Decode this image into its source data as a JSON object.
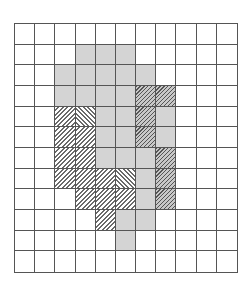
{
  "figure": {
    "rows": 12,
    "cols": 11,
    "legend": {
      "empty": "white cell",
      "gray": "gray shaded cell",
      "hr": "light diagonal hatch (\\)",
      "hl": "light diagonal hatch (/)",
      "dk": "dark diagonal hatch on gray (/)"
    },
    "cells": [
      [
        "empty",
        "empty",
        "empty",
        "empty",
        "empty",
        "empty",
        "empty",
        "empty",
        "empty",
        "empty",
        "empty"
      ],
      [
        "empty",
        "empty",
        "empty",
        "gray",
        "gray",
        "gray",
        "empty",
        "empty",
        "empty",
        "empty",
        "empty"
      ],
      [
        "empty",
        "empty",
        "gray",
        "gray",
        "gray",
        "gray",
        "gray",
        "empty",
        "empty",
        "empty",
        "empty"
      ],
      [
        "empty",
        "empty",
        "gray",
        "gray",
        "gray",
        "gray",
        "dk",
        "dk",
        "empty",
        "empty",
        "empty"
      ],
      [
        "empty",
        "empty",
        "hr",
        "hl",
        "gray",
        "gray",
        "dk",
        "gray",
        "empty",
        "empty",
        "empty"
      ],
      [
        "empty",
        "empty",
        "hr",
        "hr",
        "gray",
        "gray",
        "dk",
        "gray",
        "empty",
        "empty",
        "empty"
      ],
      [
        "empty",
        "empty",
        "hr",
        "hr",
        "gray",
        "gray",
        "gray",
        "dk",
        "empty",
        "empty",
        "empty"
      ],
      [
        "empty",
        "empty",
        "hr",
        "hr",
        "hr",
        "hl",
        "gray",
        "dk",
        "empty",
        "empty",
        "empty"
      ],
      [
        "empty",
        "empty",
        "empty",
        "hr",
        "hr",
        "hr",
        "gray",
        "dk",
        "empty",
        "empty",
        "empty"
      ],
      [
        "empty",
        "empty",
        "empty",
        "empty",
        "hr",
        "gray",
        "gray",
        "empty",
        "empty",
        "empty",
        "empty"
      ],
      [
        "empty",
        "empty",
        "empty",
        "empty",
        "empty",
        "gray",
        "empty",
        "empty",
        "empty",
        "empty",
        "empty"
      ],
      [
        "empty",
        "empty",
        "empty",
        "empty",
        "empty",
        "empty",
        "empty",
        "empty",
        "empty",
        "empty",
        "empty"
      ]
    ]
  }
}
